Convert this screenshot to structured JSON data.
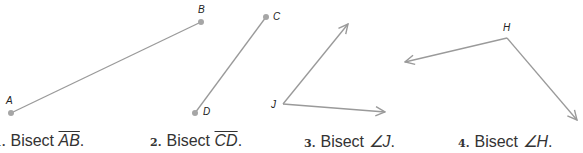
{
  "exercises": [
    {
      "number": "1.",
      "text": "Bisect",
      "object": "AB",
      "object_style": "segment",
      "suffix": "."
    },
    {
      "number": "2.",
      "text": "Bisect",
      "object": "CD",
      "object_style": "segment",
      "suffix": "."
    },
    {
      "number": "3.",
      "text": "Bisect",
      "object": "∠J",
      "object_style": "angle",
      "suffix": "."
    },
    {
      "number": "4.",
      "text": "Bisect",
      "object": "∠H",
      "object_style": "angle",
      "suffix": "."
    }
  ],
  "points": {
    "A": {
      "label": "A",
      "x": 11,
      "y": 113
    },
    "B": {
      "label": "B",
      "x": 201,
      "y": 22
    },
    "C": {
      "label": "C",
      "x": 266,
      "y": 17
    },
    "D": {
      "label": "D",
      "x": 195,
      "y": 113
    },
    "J": {
      "label": "J"
    },
    "H": {
      "label": "H"
    }
  },
  "colors": {
    "line": "#9a9a9a",
    "point": "#a6a6a6",
    "text": "#333333"
  }
}
